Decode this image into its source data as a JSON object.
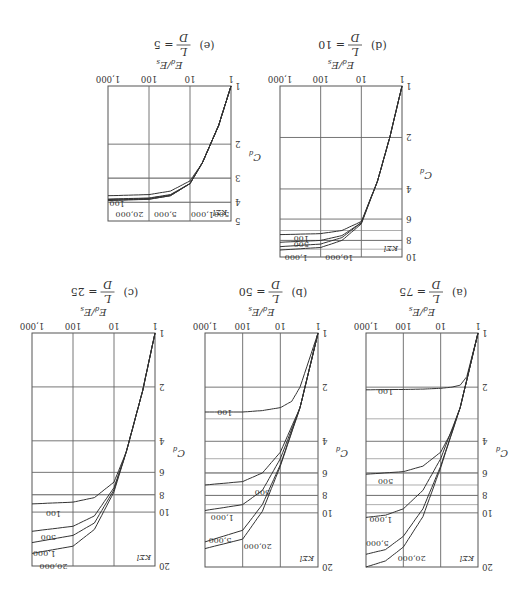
{
  "figure": {
    "orientation": "rotated 180 degrees",
    "x_axis_label": "E_d/E_s",
    "y_axis_label": "C_d",
    "param_label": "KΣl"
  },
  "chart_data": [
    {
      "id": "a",
      "type": "line",
      "title": "(a) L/D = 75",
      "caption_prefix": "(a)",
      "ld_value": "75",
      "xlabel": "E_d/E_s",
      "ylabel": "C_d",
      "xscale": "log",
      "yscale": "log",
      "xlim": [
        1,
        1000
      ],
      "ylim": [
        1,
        20
      ],
      "x_ticks": [
        "1",
        "10",
        "100",
        "1,000"
      ],
      "y_ticks": [
        "1",
        "2",
        "4",
        "6",
        "8",
        "10",
        "20"
      ],
      "legend_title": "KΣl",
      "series": [
        {
          "name": "100",
          "x": [
            1,
            2,
            3,
            5,
            10,
            30,
            100,
            1000
          ],
          "y": [
            1,
            1.75,
            1.95,
            2.0,
            2.03,
            2.05,
            2.06,
            2.07
          ]
        },
        {
          "name": "500",
          "x": [
            1,
            3,
            5,
            10,
            30,
            100,
            1000
          ],
          "y": [
            1,
            2.6,
            3.5,
            4.6,
            5.5,
            5.9,
            6.1
          ]
        },
        {
          "name": "1,000",
          "x": [
            1,
            3,
            10,
            30,
            100,
            300,
            1000
          ],
          "y": [
            1,
            2.6,
            5.0,
            7.5,
            9.5,
            10.3,
            10.6
          ]
        },
        {
          "name": "5,000",
          "x": [
            1,
            3,
            10,
            30,
            100,
            300,
            1000
          ],
          "y": [
            1,
            2.6,
            5.5,
            9.5,
            13.5,
            16,
            17
          ]
        },
        {
          "name": "20,000",
          "x": [
            1,
            3,
            10,
            30,
            100,
            300,
            1000
          ],
          "y": [
            1,
            2.6,
            5.6,
            10.5,
            15.5,
            18.5,
            20
          ]
        }
      ]
    },
    {
      "id": "b",
      "type": "line",
      "title": "(b) L/D = 50",
      "caption_prefix": "(b)",
      "ld_value": "50",
      "xlabel": "E_d/E_s",
      "ylabel": "C_d",
      "xscale": "log",
      "yscale": "log",
      "xlim": [
        1,
        1000
      ],
      "ylim": [
        1,
        20
      ],
      "x_ticks": [
        "1",
        "10",
        "100",
        "1,000"
      ],
      "y_ticks": [
        "1",
        "2",
        "4",
        "6",
        "8",
        "10",
        "20"
      ],
      "legend_title": "KΣl",
      "series": [
        {
          "name": "100",
          "x": [
            1,
            3,
            5,
            10,
            30,
            100,
            1000
          ],
          "y": [
            1,
            2.0,
            2.4,
            2.6,
            2.7,
            2.75,
            2.75
          ]
        },
        {
          "name": "500",
          "x": [
            1,
            3,
            10,
            30,
            100,
            1000
          ],
          "y": [
            1,
            2.6,
            4.6,
            6.0,
            6.7,
            7.0
          ]
        },
        {
          "name": "1,000",
          "x": [
            1,
            3,
            10,
            30,
            100,
            1000
          ],
          "y": [
            1,
            2.6,
            5.0,
            7.5,
            9.0,
            9.7
          ]
        },
        {
          "name": "5,000",
          "x": [
            1,
            3,
            10,
            30,
            100,
            1000
          ],
          "y": [
            1,
            2.6,
            5.4,
            9.0,
            12.5,
            14.5
          ]
        },
        {
          "name": "20,000",
          "x": [
            1,
            3,
            10,
            30,
            100,
            1000
          ],
          "y": [
            1,
            2.6,
            5.5,
            9.8,
            14.0,
            15.8
          ]
        }
      ]
    },
    {
      "id": "c",
      "type": "line",
      "title": "(c) L/D = 25",
      "caption_prefix": "(c)",
      "ld_value": "25",
      "xlabel": "E_d/E_s",
      "ylabel": "C_d",
      "xscale": "log",
      "yscale": "log",
      "xlim": [
        1,
        1000
      ],
      "ylim": [
        1,
        20
      ],
      "x_ticks": [
        "1",
        "10",
        "100",
        "1,000"
      ],
      "y_ticks": [
        "1",
        "2",
        "4",
        "6",
        "8",
        "10",
        "20"
      ],
      "legend_title": "KΣl",
      "series": [
        {
          "name": "100",
          "x": [
            1,
            2,
            5,
            10,
            30,
            100,
            1000
          ],
          "y": [
            1,
            2.1,
            4.6,
            6.8,
            8.3,
            8.8,
            9.0
          ]
        },
        {
          "name": "500",
          "x": [
            1,
            2,
            5,
            10,
            30,
            100,
            1000
          ],
          "y": [
            1,
            2.1,
            4.6,
            7.3,
            10.5,
            12.0,
            12.8
          ]
        },
        {
          "name": "1,000",
          "x": [
            1,
            2,
            5,
            10,
            30,
            100,
            1000
          ],
          "y": [
            1,
            2.1,
            4.6,
            7.5,
            11.5,
            13.5,
            14.8
          ]
        },
        {
          "name": "20,000",
          "x": [
            1,
            2,
            5,
            10,
            30,
            100,
            1000
          ],
          "y": [
            1,
            2.1,
            4.6,
            7.7,
            12.5,
            15.5,
            17.0
          ]
        }
      ]
    },
    {
      "id": "d",
      "type": "line",
      "title": "(d) L/D = 10",
      "caption_prefix": "(d)",
      "ld_value": "10",
      "xlabel": "E_d/E_s",
      "ylabel": "C_d",
      "xscale": "log",
      "yscale": "log",
      "xlim": [
        1,
        1000
      ],
      "ylim": [
        1,
        10
      ],
      "x_ticks": [
        "1",
        "10",
        "100",
        "1,000"
      ],
      "y_ticks": [
        "1",
        "2",
        "4",
        "6",
        "8",
        "10"
      ],
      "legend_title": "KΣl",
      "series": [
        {
          "name": "100",
          "x": [
            1,
            2,
            4,
            10,
            30,
            100,
            1000
          ],
          "y": [
            1,
            2.0,
            3.6,
            6.2,
            7.0,
            7.3,
            7.4
          ]
        },
        {
          "name": "500",
          "x": [
            1,
            2,
            4,
            10,
            30,
            100,
            1000
          ],
          "y": [
            1,
            2.0,
            3.6,
            6.3,
            7.5,
            8.0,
            8.2
          ]
        },
        {
          "name": "1,000",
          "x": [
            1,
            2,
            4,
            10,
            30,
            100,
            1000
          ],
          "y": [
            1,
            2.0,
            3.6,
            6.3,
            7.7,
            8.4,
            8.7
          ]
        },
        {
          "name": "10,000",
          "x": [
            1,
            2,
            4,
            10,
            30,
            100,
            1000
          ],
          "y": [
            1,
            2.0,
            3.6,
            6.4,
            8.0,
            8.8,
            9.1
          ]
        }
      ]
    },
    {
      "id": "e",
      "type": "line",
      "title": "(e) L/D = 5",
      "caption_prefix": "(e)",
      "ld_value": "5",
      "xlabel": "E_d/E_s",
      "ylabel": "C_d",
      "xscale": "log",
      "yscale": "log",
      "xlim": [
        1,
        1000
      ],
      "ylim": [
        1,
        5
      ],
      "x_ticks": [
        "1",
        "10",
        "100",
        "1,000"
      ],
      "y_ticks": [
        "1",
        "2",
        "3",
        "4",
        "5"
      ],
      "legend_title": "KΣl",
      "series": [
        {
          "name": "100",
          "x": [
            1,
            2,
            5,
            10,
            30,
            100,
            1000
          ],
          "y": [
            1,
            1.6,
            2.5,
            3.1,
            3.5,
            3.65,
            3.7
          ]
        },
        {
          "name": "500",
          "x": [
            1,
            2,
            5,
            10,
            30,
            100,
            1000
          ],
          "y": [
            1,
            1.6,
            2.5,
            3.2,
            3.65,
            3.8,
            3.85
          ]
        },
        {
          "name": "1,000",
          "x": [
            1,
            2,
            5,
            10,
            30,
            100,
            1000
          ],
          "y": [
            1,
            1.6,
            2.5,
            3.2,
            3.67,
            3.82,
            3.87
          ]
        },
        {
          "name": "5,000",
          "x": [
            1,
            2,
            5,
            10,
            30,
            100,
            1000
          ],
          "y": [
            1,
            1.6,
            2.5,
            3.2,
            3.7,
            3.85,
            3.9
          ]
        },
        {
          "name": "20,000",
          "x": [
            1,
            2,
            5,
            10,
            30,
            100,
            1000
          ],
          "y": [
            1,
            1.6,
            2.5,
            3.2,
            3.7,
            3.86,
            3.92
          ]
        }
      ]
    }
  ],
  "layout": {
    "a": {
      "X": 49,
      "Y": 36,
      "W": 112,
      "H": 234
    },
    "b": {
      "X": 209,
      "Y": 36,
      "W": 113,
      "H": 234
    },
    "c": {
      "X": 372,
      "Y": 37,
      "W": 123,
      "H": 233
    },
    "d": {
      "X": 125,
      "Y": 346,
      "W": 122,
      "H": 171
    },
    "e": {
      "X": 296,
      "Y": 382,
      "W": 123,
      "H": 135
    }
  },
  "minor_c_lines": {
    "a": [
      3,
      5,
      6,
      7,
      8,
      9
    ],
    "b": [
      3,
      5,
      6,
      7,
      8,
      9
    ],
    "c": [
      8
    ],
    "d": [
      7,
      8,
      9
    ],
    "e": [
      3,
      4
    ]
  },
  "curve_labels": {
    "a": [
      {
        "text": "100",
        "x": 300,
        "y": 2.0
      },
      {
        "text": "500",
        "x": 300,
        "y": 6.3
      },
      {
        "text": "1,000",
        "x": 400,
        "y": 10.3
      },
      {
        "text": "5,000",
        "x": 500,
        "y": 14
      },
      {
        "text": "20,000",
        "x": 60,
        "y": 17
      }
    ],
    "b": [
      {
        "text": "100",
        "x": 300,
        "y": 2.6
      },
      {
        "text": "500",
        "x": 30,
        "y": 7.3
      },
      {
        "text": "1,000",
        "x": 350,
        "y": 10.0
      },
      {
        "text": "5,000",
        "x": 400,
        "y": 13.5
      },
      {
        "text": "20,000",
        "x": 40,
        "y": 14.5
      }
    ],
    "c": [
      {
        "text": "100",
        "x": 300,
        "y": 9.6
      },
      {
        "text": "500",
        "x": 400,
        "y": 13
      },
      {
        "text": "1,000",
        "x": 500,
        "y": 16
      },
      {
        "text": "20,000",
        "x": 300,
        "y": 19
      }
    ],
    "d": [
      {
        "text": "100",
        "x": 300,
        "y": 7.3
      },
      {
        "text": "500",
        "x": 300,
        "y": 8.0
      },
      {
        "text": "1,000",
        "x": 400,
        "y": 9.5
      },
      {
        "text": "10,000",
        "x": 35,
        "y": 9.5
      }
    ],
    "e": [
      {
        "text": "100",
        "x": 600,
        "y": 3.85
      },
      {
        "text": "500",
        "x": 1.7,
        "y": 4.4
      },
      {
        "text": "1,000",
        "x": 5,
        "y": 4.4
      },
      {
        "text": "5,000",
        "x": 40,
        "y": 4.4
      },
      {
        "text": "20,000",
        "x": 300,
        "y": 4.4
      }
    ]
  }
}
